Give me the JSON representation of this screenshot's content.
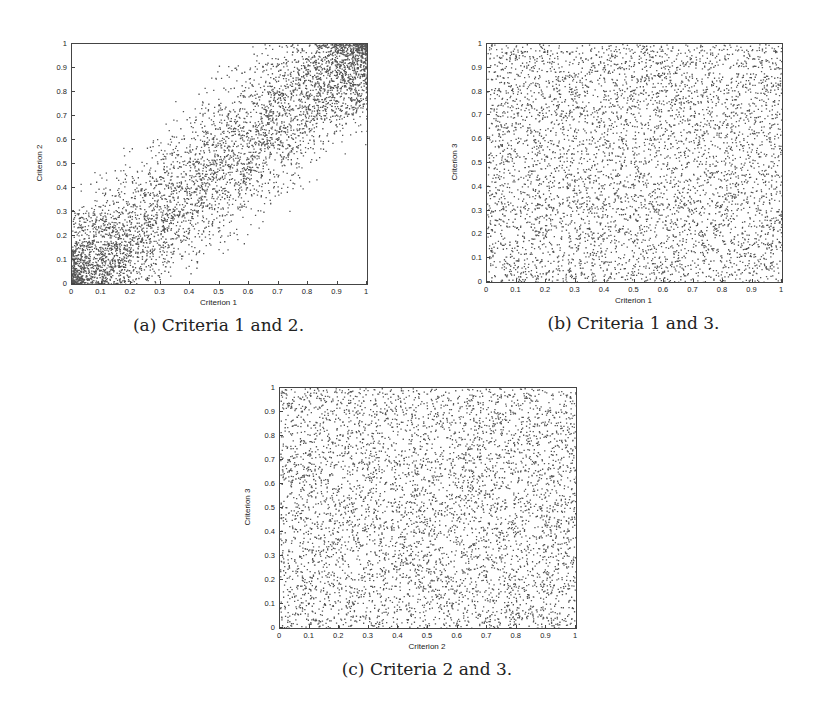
{
  "chart_data": [
    {
      "type": "scatter",
      "id": "a",
      "caption": "(a) Criteria 1 and 2.",
      "xlabel": "Criterion 1",
      "ylabel": "Criterion 2",
      "xlim": [
        0,
        1
      ],
      "ylim": [
        0,
        1
      ],
      "xticks": [
        "0",
        "0.1",
        "0.2",
        "0.3",
        "0.4",
        "0.5",
        "0.6",
        "0.7",
        "0.8",
        "0.9",
        "1"
      ],
      "yticks": [
        "0",
        "0.1",
        "0.2",
        "0.3",
        "0.4",
        "0.5",
        "0.6",
        "0.7",
        "0.8",
        "0.9",
        "1"
      ],
      "grid": false,
      "marker_color": "#555555",
      "distribution": "positively correlated; dense clusters near (0,0) and (1,1), sparse near (1,0) and (0,1)",
      "n_points": 5000,
      "correlation": 0.55
    },
    {
      "type": "scatter",
      "id": "b",
      "caption": "(b) Criteria 1 and 3.",
      "xlabel": "Criterion 1",
      "ylabel": "Criterion 3",
      "xlim": [
        0,
        1
      ],
      "ylim": [
        0,
        1
      ],
      "xticks": [
        "0",
        "0.1",
        "0.2",
        "0.3",
        "0.4",
        "0.5",
        "0.6",
        "0.7",
        "0.8",
        "0.9",
        "1"
      ],
      "yticks": [
        "0",
        "0.1",
        "0.2",
        "0.3",
        "0.4",
        "0.5",
        "0.6",
        "0.7",
        "0.8",
        "0.9",
        "1"
      ],
      "grid": false,
      "marker_color": "#555555",
      "distribution": "uniform, uncorrelated",
      "n_points": 5000,
      "correlation": 0
    },
    {
      "type": "scatter",
      "id": "c",
      "caption": "(c) Criteria 2 and 3.",
      "xlabel": "Criterion 2",
      "ylabel": "Criterion 3",
      "xlim": [
        0,
        1
      ],
      "ylim": [
        0,
        1
      ],
      "xticks": [
        "0",
        "0.1",
        "0.2",
        "0.3",
        "0.4",
        "0.5",
        "0.6",
        "0.7",
        "0.8",
        "0.9",
        "1"
      ],
      "yticks": [
        "0",
        "0.1",
        "0.2",
        "0.3",
        "0.4",
        "0.5",
        "0.6",
        "0.7",
        "0.8",
        "0.9",
        "1"
      ],
      "grid": false,
      "marker_color": "#555555",
      "distribution": "uniform, uncorrelated",
      "n_points": 5000,
      "correlation": 0
    }
  ]
}
